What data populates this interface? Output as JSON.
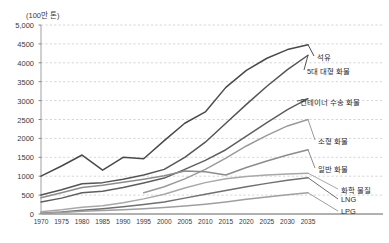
{
  "chart_data": {
    "type": "line",
    "title": "(100만 톤)",
    "xlabel": "",
    "ylabel": "",
    "unit_note": "(100만 톤)",
    "grid": true,
    "legend_position": "right-inline-labels",
    "xlim": [
      1970,
      2035
    ],
    "ylim": [
      0,
      5000
    ],
    "ytick_labels": [
      "0",
      "500",
      "1000",
      "1500",
      "2000",
      "2500",
      "3000",
      "3500",
      "4000",
      "4500",
      "5,000"
    ],
    "ytick_values": [
      0,
      500,
      1000,
      1500,
      2000,
      2500,
      3000,
      3500,
      4000,
      4500,
      5000
    ],
    "categories": [
      1970,
      1975,
      1980,
      1985,
      1990,
      1995,
      2000,
      2005,
      2010,
      2015,
      2020,
      2025,
      2030,
      2035
    ],
    "xtick_labels": [
      "1970",
      "1975",
      "1980",
      "1985",
      "1990",
      "1995",
      "2000",
      "2005",
      "2010",
      "2015",
      "2020",
      "2025",
      "2030",
      "2035"
    ],
    "series": [
      {
        "name": "석유",
        "label": "석유",
        "color": "#4a4a4a",
        "values": [
          1000,
          1270,
          1560,
          1160,
          1500,
          1460,
          1940,
          2400,
          2700,
          3350,
          3800,
          4120,
          4350,
          4480
        ]
      },
      {
        "name": "5대 대형 화물",
        "label": "5대 대형 화물",
        "color": "#555555",
        "values": [
          500,
          640,
          800,
          830,
          920,
          1030,
          1180,
          1500,
          1900,
          2400,
          2900,
          3380,
          3820,
          4200
        ]
      },
      {
        "name": "컨테이너 수송 화물",
        "label": "컨테이너 수송 화물",
        "color": "#5e5e5e",
        "values": [
          320,
          420,
          560,
          600,
          700,
          820,
          950,
          1180,
          1420,
          1700,
          2060,
          2420,
          2760,
          3050
        ]
      },
      {
        "name": "소형 화물",
        "label": "소형 화물",
        "color": "#9a9a9a",
        "values": [
          null,
          null,
          null,
          null,
          null,
          560,
          720,
          930,
          1180,
          1480,
          1800,
          2080,
          2330,
          2500
        ]
      },
      {
        "name": "일반 화물",
        "label": "일반 화물",
        "color": "#8c8c8c",
        "values": [
          430,
          560,
          700,
          760,
          840,
          920,
          1010,
          1140,
          1120,
          1030,
          1230,
          1400,
          1560,
          1700
        ]
      },
      {
        "name": "화학 물질",
        "label": "화학 물질",
        "color": "#a8a8a8",
        "values": [
          60,
          110,
          180,
          220,
          300,
          400,
          520,
          690,
          830,
          930,
          990,
          1030,
          1060,
          1080
        ]
      },
      {
        "name": "LNG",
        "label": "LNG",
        "color": "#707070",
        "values": [
          20,
          50,
          100,
          140,
          190,
          250,
          320,
          420,
          520,
          620,
          720,
          810,
          890,
          960
        ]
      },
      {
        "name": "LPG",
        "label": "LPG",
        "color": "#9f9f9f",
        "values": [
          20,
          40,
          70,
          90,
          110,
          140,
          170,
          210,
          260,
          320,
          390,
          450,
          510,
          560
        ]
      }
    ],
    "series_labels": [
      {
        "text": "석유",
        "x": 317,
        "y": 56
      },
      {
        "text": "5대 대형 화물",
        "x": 307,
        "y": 70
      },
      {
        "text": "컨테이너 수송 화물",
        "x": 300,
        "y": 101
      },
      {
        "text": "소형 화물",
        "x": 318,
        "y": 140
      },
      {
        "text": "일반 화물",
        "x": 318,
        "y": 168
      },
      {
        "text": "화학 물질",
        "x": 341,
        "y": 189
      },
      {
        "text": "LNG",
        "x": 341,
        "y": 199
      },
      {
        "text": "LPG",
        "x": 341,
        "y": 211
      }
    ]
  },
  "axes": {
    "plot_left": 41,
    "plot_right": 308,
    "plot_top": 25,
    "plot_bottom": 214
  }
}
